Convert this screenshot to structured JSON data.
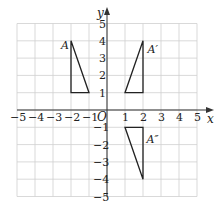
{
  "diagram": {
    "type": "coordinate-grid-transformations",
    "axes": {
      "x_label": "x",
      "y_label": "y",
      "origin_label": "O",
      "x_range": [
        -5,
        5
      ],
      "y_range": [
        -5,
        5
      ],
      "x_ticks": [
        "-5",
        "-4",
        "-3",
        "-2",
        "-1",
        "1",
        "2",
        "3",
        "4",
        "5"
      ],
      "y_ticks": [
        "5",
        "4",
        "3",
        "2",
        "1",
        "-1",
        "-2",
        "-3",
        "-4",
        "-5"
      ],
      "grid": true
    },
    "shapes": [
      {
        "label": "A",
        "vertices": [
          [
            -2,
            4
          ],
          [
            -2,
            1
          ],
          [
            -1,
            1
          ]
        ]
      },
      {
        "label": "A′",
        "vertices": [
          [
            2,
            4
          ],
          [
            2,
            1
          ],
          [
            1,
            1
          ]
        ]
      },
      {
        "label": "A″",
        "vertices": [
          [
            1,
            -1
          ],
          [
            2,
            -1
          ],
          [
            2,
            -4
          ]
        ]
      }
    ],
    "colors": {
      "grid": "#cfcfcf",
      "axes": "#333333",
      "shape_stroke": "#222222"
    }
  }
}
